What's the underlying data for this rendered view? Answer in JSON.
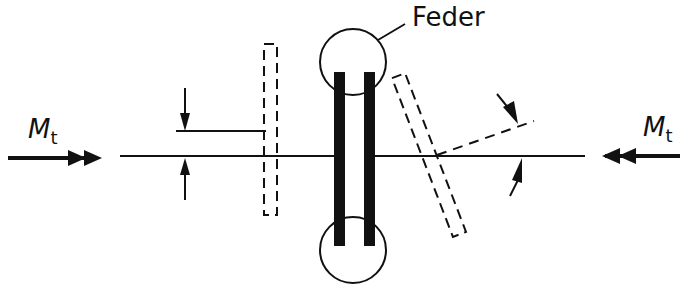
{
  "diagram": {
    "labels": {
      "spring": "Feder",
      "torque_left_symbol": "M",
      "torque_left_sub": "t",
      "torque_right_symbol": "M",
      "torque_right_sub": "t"
    },
    "colors": {
      "stroke": "#111111",
      "background": "#ffffff"
    }
  }
}
